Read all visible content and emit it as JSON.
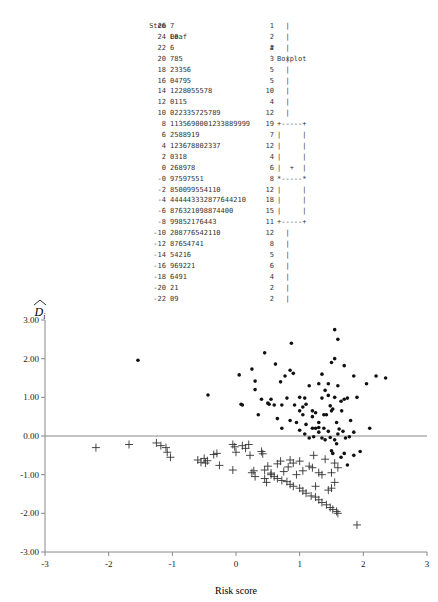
{
  "stem_leaf": {
    "headers": {
      "stem": "Stem",
      "leaf": "Leaf",
      "count": "#",
      "boxplot": "Boxplot"
    },
    "rows": [
      {
        "stem": "26",
        "leaf": "7",
        "count": "1",
        "box": "  |"
      },
      {
        "stem": "24",
        "leaf": "00",
        "count": "2",
        "box": "  |"
      },
      {
        "stem": "22",
        "leaf": "6",
        "count": "1",
        "box": "  |"
      },
      {
        "stem": "20",
        "leaf": "785",
        "count": "3",
        "box": "  |"
      },
      {
        "stem": "18",
        "leaf": "23356",
        "count": "5",
        "box": "  |"
      },
      {
        "stem": "16",
        "leaf": "04795",
        "count": "5",
        "box": "  |"
      },
      {
        "stem": "14",
        "leaf": "1228055578",
        "count": "10",
        "box": "  |"
      },
      {
        "stem": "12",
        "leaf": "0115",
        "count": "4",
        "box": "  |"
      },
      {
        "stem": "10",
        "leaf": "022335725789",
        "count": "12",
        "box": "  |"
      },
      {
        "stem": "8",
        "leaf": "1135690001233889999",
        "count": "19",
        "box": "+-----+"
      },
      {
        "stem": "6",
        "leaf": "2588919",
        "count": "7",
        "box": "|     |"
      },
      {
        "stem": "4",
        "leaf": "123678802337",
        "count": "12",
        "box": "|     |"
      },
      {
        "stem": "2",
        "leaf": "0318",
        "count": "4",
        "box": "|     |"
      },
      {
        "stem": "0",
        "leaf": "268978",
        "count": "6",
        "box": "|  +  |"
      },
      {
        "stem": "-0",
        "leaf": "97597551",
        "count": "8",
        "box": "*-----*"
      },
      {
        "stem": "-2",
        "leaf": "850099554110",
        "count": "12",
        "box": "|     |"
      },
      {
        "stem": "-4",
        "leaf": "444443332877644210",
        "count": "18",
        "box": "|     |"
      },
      {
        "stem": "-6",
        "leaf": "876321098874400",
        "count": "15",
        "box": "|     |"
      },
      {
        "stem": "-8",
        "leaf": "99852176443",
        "count": "11",
        "box": "+-----+"
      },
      {
        "stem": "-10",
        "leaf": "208776542110",
        "count": "12",
        "box": "  |"
      },
      {
        "stem": "-12",
        "leaf": "87654741",
        "count": "8",
        "box": "  |"
      },
      {
        "stem": "-14",
        "leaf": "54216",
        "count": "5",
        "box": "  |"
      },
      {
        "stem": "-16",
        "leaf": "969221",
        "count": "6",
        "box": "  |"
      },
      {
        "stem": "-18",
        "leaf": "6491",
        "count": "4",
        "box": "  |"
      },
      {
        "stem": "-20",
        "leaf": "21",
        "count": "2",
        "box": "  |"
      },
      {
        "stem": "-22",
        "leaf": "09",
        "count": "2",
        "box": "  |"
      }
    ]
  },
  "chart_data": {
    "type": "scatter",
    "title": "",
    "xlabel": "Risk score",
    "ylabel": "D̂i",
    "xlim": [
      -3,
      3
    ],
    "ylim": [
      -3,
      3
    ],
    "xticks": [
      "-3",
      "-2",
      "-1",
      "0",
      "1",
      "2",
      "3"
    ],
    "yticks": [
      "3.00",
      "2.00",
      "1.00",
      "0.00",
      "-1.00",
      "-2.00",
      "-3.00"
    ],
    "grid": false,
    "reference_line_y": 0,
    "series": [
      {
        "name": "events",
        "marker": "dot",
        "points": [
          [
            -1.54,
            1.96
          ],
          [
            -0.44,
            1.06
          ],
          [
            0.05,
            1.58
          ],
          [
            0.1,
            0.8
          ],
          [
            0.08,
            0.82
          ],
          [
            0.25,
            1.73
          ],
          [
            0.3,
            1.2
          ],
          [
            0.3,
            1.42
          ],
          [
            0.45,
            2.15
          ],
          [
            0.62,
            1.86
          ],
          [
            0.52,
            0.82
          ],
          [
            0.55,
            0.95
          ],
          [
            0.6,
            0.8
          ],
          [
            0.72,
            0.8
          ],
          [
            0.7,
            1.4
          ],
          [
            0.85,
            1.7
          ],
          [
            0.8,
            0.98
          ],
          [
            0.9,
            1.62
          ],
          [
            0.77,
            1.55
          ],
          [
            1.0,
            1.0
          ],
          [
            1.05,
            0.75
          ],
          [
            0.87,
            2.4
          ],
          [
            0.92,
            0.8
          ],
          [
            1.0,
            0.65
          ],
          [
            1.1,
            0.82
          ],
          [
            1.08,
            0.98
          ],
          [
            1.15,
            1.3
          ],
          [
            1.2,
            0.2
          ],
          [
            1.2,
            0.5
          ],
          [
            1.25,
            0.6
          ],
          [
            1.3,
            0.35
          ],
          [
            1.3,
            0.22
          ],
          [
            1.2,
            0.65
          ],
          [
            1.3,
            1.35
          ],
          [
            1.35,
            0.98
          ],
          [
            1.38,
            0.55
          ],
          [
            1.42,
            0.55
          ],
          [
            1.35,
            1.6
          ],
          [
            1.4,
            1.18
          ],
          [
            1.45,
            1.05
          ],
          [
            1.48,
            0.78
          ],
          [
            1.5,
            0.65
          ],
          [
            1.52,
            0.7
          ],
          [
            1.55,
            1.0
          ],
          [
            1.5,
            1.9
          ],
          [
            1.55,
            2.0
          ],
          [
            1.55,
            2.75
          ],
          [
            1.6,
            2.5
          ],
          [
            1.66,
            0.65
          ],
          [
            1.7,
            1.82
          ],
          [
            1.6,
            1.3
          ],
          [
            1.45,
            1.35
          ],
          [
            1.48,
            -0.04
          ],
          [
            1.6,
            0.05
          ],
          [
            1.55,
            -0.1
          ],
          [
            1.65,
            0.9
          ],
          [
            1.7,
            0.95
          ],
          [
            1.75,
            0.98
          ],
          [
            1.8,
            0.4
          ],
          [
            1.72,
            -0.05
          ],
          [
            1.78,
            -0.02
          ],
          [
            1.85,
            1.55
          ],
          [
            1.9,
            1.0
          ],
          [
            2.05,
            1.35
          ],
          [
            2.1,
            0.2
          ],
          [
            2.2,
            1.55
          ],
          [
            2.35,
            1.5
          ],
          [
            1.85,
            0.1
          ],
          [
            1.4,
            -0.1
          ],
          [
            1.38,
            0.2
          ],
          [
            1.25,
            0.2
          ],
          [
            1.1,
            0.3
          ],
          [
            1.0,
            0.15
          ],
          [
            1.08,
            0.05
          ],
          [
            1.15,
            -0.05
          ],
          [
            1.22,
            -0.02
          ],
          [
            1.3,
            0.1
          ],
          [
            1.35,
            -0.05
          ],
          [
            1.45,
            0.12
          ],
          [
            1.58,
            0.35
          ],
          [
            1.62,
            0.18
          ],
          [
            1.68,
            0.12
          ],
          [
            1.5,
            -0.38
          ],
          [
            1.52,
            -0.45
          ],
          [
            1.65,
            -0.55
          ],
          [
            1.7,
            -0.45
          ],
          [
            1.85,
            -0.5
          ],
          [
            1.95,
            -0.4
          ],
          [
            1.75,
            -0.75
          ],
          [
            1.58,
            -0.2
          ],
          [
            0.72,
            0.2
          ],
          [
            0.85,
            0.4
          ],
          [
            0.95,
            0.35
          ],
          [
            1.05,
            0.55
          ],
          [
            0.65,
            0.45
          ],
          [
            0.5,
            0.85
          ],
          [
            0.4,
            0.95
          ],
          [
            0.35,
            0.55
          ]
        ]
      },
      {
        "name": "non-events",
        "marker": "plus",
        "points": [
          [
            -2.2,
            -0.3
          ],
          [
            -1.68,
            -0.22
          ],
          [
            -1.25,
            -0.18
          ],
          [
            -1.18,
            -0.25
          ],
          [
            -1.1,
            -0.3
          ],
          [
            -1.08,
            -0.42
          ],
          [
            -1.03,
            -0.55
          ],
          [
            -0.6,
            -0.62
          ],
          [
            -0.55,
            -0.68
          ],
          [
            -0.5,
            -0.58
          ],
          [
            -0.48,
            -0.7
          ],
          [
            -0.45,
            -0.64
          ],
          [
            -0.35,
            -0.48
          ],
          [
            -0.3,
            -0.45
          ],
          [
            -0.26,
            -0.76
          ],
          [
            -0.05,
            -0.22
          ],
          [
            -0.02,
            -0.28
          ],
          [
            0.0,
            -0.42
          ],
          [
            -0.05,
            -0.88
          ],
          [
            0.1,
            -0.25
          ],
          [
            0.15,
            -0.32
          ],
          [
            0.2,
            -0.22
          ],
          [
            0.22,
            -0.5
          ],
          [
            0.25,
            -0.95
          ],
          [
            0.28,
            -0.9
          ],
          [
            0.4,
            -0.4
          ],
          [
            0.42,
            -0.46
          ],
          [
            0.45,
            -0.88
          ],
          [
            0.5,
            -0.78
          ],
          [
            0.55,
            -0.96
          ],
          [
            0.65,
            -0.72
          ],
          [
            0.7,
            -0.65
          ],
          [
            0.75,
            -0.92
          ],
          [
            0.82,
            -0.8
          ],
          [
            0.85,
            -0.62
          ],
          [
            0.9,
            -0.7
          ],
          [
            0.6,
            -1.05
          ],
          [
            0.65,
            -1.1
          ],
          [
            0.72,
            -1.15
          ],
          [
            0.8,
            -1.18
          ],
          [
            0.85,
            -1.25
          ],
          [
            0.9,
            -1.3
          ],
          [
            1.0,
            -1.35
          ],
          [
            1.05,
            -1.42
          ],
          [
            1.1,
            -1.48
          ],
          [
            1.18,
            -1.55
          ],
          [
            1.25,
            -1.58
          ],
          [
            1.3,
            -1.65
          ],
          [
            1.35,
            -1.72
          ],
          [
            1.42,
            -1.78
          ],
          [
            1.48,
            -1.85
          ],
          [
            1.52,
            -1.9
          ],
          [
            1.58,
            -1.95
          ],
          [
            1.6,
            -2.0
          ],
          [
            1.9,
            -2.3
          ],
          [
            1.5,
            -1.35
          ],
          [
            1.15,
            -0.78
          ],
          [
            1.2,
            -0.82
          ],
          [
            1.3,
            -0.95
          ],
          [
            1.35,
            -1.0
          ],
          [
            1.05,
            -0.9
          ],
          [
            0.95,
            -1.0
          ],
          [
            1.25,
            -1.3
          ],
          [
            1.45,
            -1.4
          ],
          [
            1.55,
            -1.2
          ],
          [
            1.5,
            -0.95
          ],
          [
            1.4,
            -0.6
          ],
          [
            1.55,
            -0.7
          ],
          [
            1.6,
            -0.82
          ],
          [
            1.22,
            -0.5
          ],
          [
            1.0,
            -0.65
          ],
          [
            0.3,
            -1.05
          ],
          [
            0.45,
            -1.1
          ],
          [
            0.55,
            -1.0
          ],
          [
            0.48,
            -1.2
          ]
        ]
      }
    ]
  }
}
